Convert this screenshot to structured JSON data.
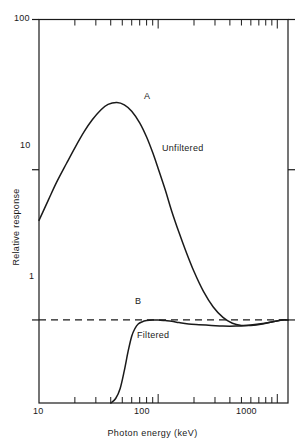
{
  "chart_data": {
    "type": "line",
    "title": "",
    "xlabel": "Photon energy (keV)",
    "ylabel": "Relative response",
    "xscale": "log",
    "yscale": "log",
    "xlim": [
      10,
      1230
    ],
    "ylim": [
      0.28,
      100
    ],
    "grid": false,
    "legend": "inline-annotations",
    "x_tick_labels": [
      "10",
      "100",
      "1000"
    ],
    "x_tick_values": [
      10,
      100,
      1000
    ],
    "x_minor_ticks": [
      20,
      30,
      40,
      50,
      60,
      70,
      80,
      90,
      200,
      300,
      400,
      500,
      600,
      700,
      800,
      900
    ],
    "y_tick_labels": [
      "1",
      "10",
      "100"
    ],
    "y_tick_values": [
      1,
      10,
      100
    ],
    "reference_line": {
      "name": "unity-response",
      "y": 1,
      "style": "dashed",
      "color": "#1a1a1a"
    },
    "series": [
      {
        "name": "A",
        "label": "Unfiltered",
        "annotation_letter": "A",
        "color": "#1a1a1a",
        "points": [
          [
            10,
            4.6
          ],
          [
            12,
            6.3
          ],
          [
            14,
            8.2
          ],
          [
            17,
            11.0
          ],
          [
            20,
            14.0
          ],
          [
            24,
            18.0
          ],
          [
            28,
            21.5
          ],
          [
            33,
            25.0
          ],
          [
            38,
            27.2
          ],
          [
            45,
            28.0
          ],
          [
            52,
            27.0
          ],
          [
            60,
            24.5
          ],
          [
            70,
            20.5
          ],
          [
            80,
            16.5
          ],
          [
            90,
            13.0
          ],
          [
            100,
            10.2
          ],
          [
            115,
            7.3
          ],
          [
            130,
            5.3
          ],
          [
            150,
            3.8
          ],
          [
            170,
            2.9
          ],
          [
            200,
            2.1
          ],
          [
            240,
            1.55
          ],
          [
            290,
            1.22
          ],
          [
            350,
            1.04
          ],
          [
            420,
            0.95
          ],
          [
            500,
            0.92
          ],
          [
            600,
            0.92
          ],
          [
            750,
            0.94
          ],
          [
            900,
            0.97
          ],
          [
            1100,
            1.0
          ],
          [
            1230,
            1.0
          ]
        ]
      },
      {
        "name": "B",
        "label": "Filtered",
        "annotation_letter": "B",
        "color": "#1a1a1a",
        "points": [
          [
            40,
            0.28
          ],
          [
            44,
            0.3
          ],
          [
            48,
            0.35
          ],
          [
            52,
            0.46
          ],
          [
            56,
            0.62
          ],
          [
            60,
            0.78
          ],
          [
            64,
            0.88
          ],
          [
            68,
            0.94
          ],
          [
            73,
            0.97
          ],
          [
            80,
            0.99
          ],
          [
            90,
            1.0
          ],
          [
            100,
            1.0
          ],
          [
            115,
            0.99
          ],
          [
            130,
            0.98
          ],
          [
            150,
            0.96
          ],
          [
            180,
            0.94
          ],
          [
            220,
            0.93
          ],
          [
            280,
            0.92
          ],
          [
            350,
            0.91
          ],
          [
            450,
            0.91
          ],
          [
            550,
            0.92
          ],
          [
            700,
            0.94
          ],
          [
            900,
            0.97
          ],
          [
            1100,
            1.0
          ],
          [
            1230,
            1.0
          ]
        ]
      }
    ],
    "annotations": [
      {
        "text": "A",
        "x": 62,
        "y": 21
      },
      {
        "text": "Unfiltered",
        "x": 125,
        "y": 8.2
      },
      {
        "text": "B",
        "x": 62,
        "y": 0.73
      },
      {
        "text": "Filtered",
        "x": 66,
        "y": 0.5
      }
    ]
  },
  "axes": {
    "x_title": "Photon energy (keV)",
    "y_title": "Relative response",
    "x_labels": {
      "low": "10",
      "mid": "100",
      "high": "1000"
    },
    "y_labels": {
      "low": "1",
      "mid": "10",
      "high": "100"
    }
  },
  "labels": {
    "curve_a": "A",
    "curve_a_name": "Unfiltered",
    "curve_b": "B",
    "curve_b_name": "Filtered"
  },
  "colors": {
    "ink": "#1a1a1a",
    "background": "#ffffff",
    "curve": "#1a1a1a",
    "reference": "#1a1a1a"
  }
}
